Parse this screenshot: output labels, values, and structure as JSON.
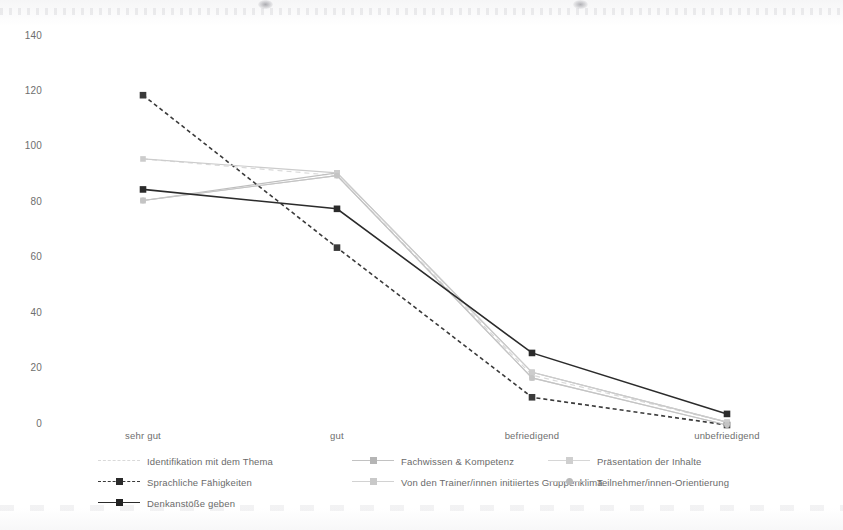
{
  "chart_data": {
    "type": "line",
    "title": "",
    "subtitle": "",
    "xlabel": "",
    "ylabel": "",
    "categories": [
      "sehr gut",
      "gut",
      "befriedigend",
      "unbefriedigend"
    ],
    "ylim": [
      0,
      140
    ],
    "yticks": [
      0,
      20,
      40,
      60,
      80,
      100,
      120,
      140
    ],
    "grid": false,
    "legend_position": "bottom",
    "series": [
      {
        "name": "Identifikation mit dem Thema",
        "values": [
          96,
          90,
          18,
          1
        ],
        "color": "#d9d9d9",
        "style": "dashed",
        "marker": "none"
      },
      {
        "name": "Fachwissen & Kompetenz",
        "values": [
          81,
          91,
          19,
          1
        ],
        "color": "#bfbfbf",
        "style": "solid",
        "marker": "square"
      },
      {
        "name": "Präsentation der Inhalte",
        "values": [
          81,
          90,
          17,
          0
        ],
        "color": "#d0d0d0",
        "style": "solid",
        "marker": "square"
      },
      {
        "name": "Sprachliche Fähigkeiten",
        "values": [
          119,
          64,
          10,
          0
        ],
        "color": "#3a3a3a",
        "style": "dashed",
        "marker": "square"
      },
      {
        "name": "Von den Trainer/innen initiiertes Gruppenklima",
        "values": [
          96,
          91,
          19,
          1
        ],
        "color": "#cccccc",
        "style": "solid",
        "marker": "square"
      },
      {
        "name": "Teilnehmer/innen-Orientierung",
        "values": [
          81,
          90,
          17,
          0
        ],
        "color": "#c4c4c4",
        "style": "solid",
        "marker": "circle"
      },
      {
        "name": "Denkanstöße geben",
        "values": [
          85,
          78,
          26,
          4
        ],
        "color": "#2b2b2b",
        "style": "solid",
        "marker": "square"
      }
    ]
  },
  "axes": {
    "y_tick_labels": [
      "140",
      "120",
      "100",
      "80",
      "60",
      "40",
      "20",
      "0"
    ],
    "x_tick_labels": [
      "sehr gut",
      "gut",
      "befriedigend",
      "unbefriedigend"
    ]
  },
  "legend": {
    "items": [
      {
        "label": "Identifikation mit dem Thema"
      },
      {
        "label": "Fachwissen & Kompetenz"
      },
      {
        "label": "Präsentation der Inhalte"
      },
      {
        "label": "Sprachliche Fähigkeiten"
      },
      {
        "label": "Von den Trainer/innen initiiertes Gruppenklima"
      },
      {
        "label": "Teilnehmer/innen-Orientierung"
      },
      {
        "label": "Denkanstöße geben"
      }
    ]
  }
}
